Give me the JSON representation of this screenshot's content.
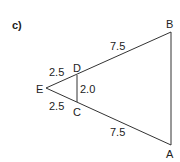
{
  "part_label": "c)",
  "vertices": {
    "A": "A",
    "B": "B",
    "C": "C",
    "D": "D",
    "E": "E"
  },
  "measurements": {
    "ED": "2.5",
    "EC": "2.5",
    "DB": "7.5",
    "CA": "7.5",
    "DC": "2.0"
  }
}
